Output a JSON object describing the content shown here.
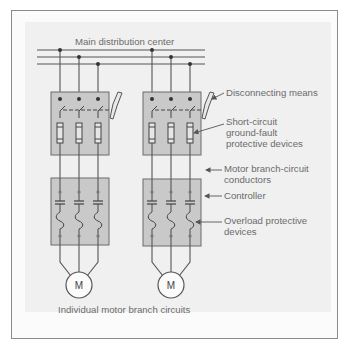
{
  "diagram": {
    "title": "Main distribution center",
    "caption": "Individual motor branch circuits",
    "motor_label": "M",
    "callouts": {
      "disconnect": "Disconnecting means",
      "short_circuit_1": "Short-circuit",
      "short_circuit_2": "ground-fault",
      "short_circuit_3": "protective devices",
      "conductors_1": "Motor branch-circuit",
      "conductors_2": "conductors",
      "controller": "Controller",
      "overload_1": "Overload protective",
      "overload_2": "devices"
    },
    "colors": {
      "box_fill": "#c9c9c9",
      "box_stroke": "#6a6a6a",
      "wire": "#555555",
      "text": "#6b6b6b"
    }
  }
}
